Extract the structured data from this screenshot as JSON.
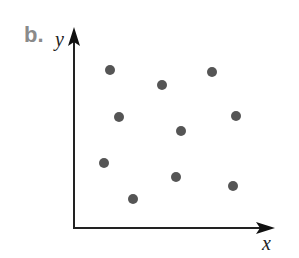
{
  "panel": {
    "label": "b."
  },
  "chart_data": {
    "type": "scatter",
    "title": "",
    "xlabel": "x",
    "ylabel": "y",
    "grid": false,
    "legend": null,
    "axis_ticks": "none",
    "colors": {
      "point": "#555555",
      "axis": "#222222",
      "label": "#8a8a8a"
    },
    "points_pixel": [
      {
        "x": 110,
        "y": 70
      },
      {
        "x": 162,
        "y": 85
      },
      {
        "x": 212,
        "y": 72
      },
      {
        "x": 119,
        "y": 117
      },
      {
        "x": 181,
        "y": 131
      },
      {
        "x": 236,
        "y": 116
      },
      {
        "x": 104,
        "y": 163
      },
      {
        "x": 176,
        "y": 177
      },
      {
        "x": 233,
        "y": 186
      },
      {
        "x": 133,
        "y": 199
      }
    ]
  }
}
